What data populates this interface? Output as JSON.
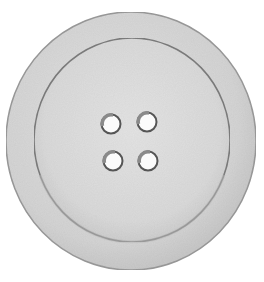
{
  "image": {
    "subject": "sewing button",
    "description": "Grayscale pencil-style illustration of a round four-hole sewing button with a raised outer rim",
    "background_color": "#ffffff"
  },
  "button": {
    "hole_count": 4,
    "colors": {
      "rim_fill": "#d6d6d6",
      "rim_outline": "#9a9a9a",
      "face_fill": "#dcdcdc",
      "face_outline": "#7d7d7d",
      "hole_fill": "#fbfbfb",
      "hole_outline": "#555555"
    }
  }
}
